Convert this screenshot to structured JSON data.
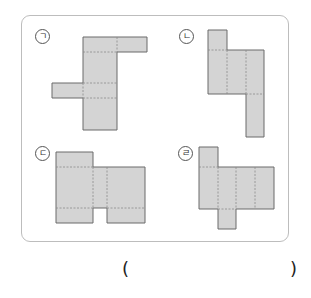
{
  "problem": {
    "labels": [
      "ㄱ",
      "ㄴ",
      "ㄷ",
      "ㄹ"
    ],
    "answer_open": "(",
    "answer_close": ")",
    "answer_value": ""
  },
  "colors": {
    "face_fill": "#d4d4d4",
    "edge": "#6b6b6b",
    "fold_line": "#8a8a8a",
    "panel_border": "#bdbdbd"
  }
}
